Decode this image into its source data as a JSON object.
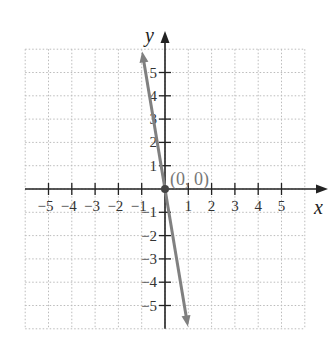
{
  "chart_data": {
    "type": "line",
    "title": "",
    "xlabel": "x",
    "ylabel": "y",
    "xlim": [
      -6,
      6
    ],
    "ylim": [
      -6,
      6
    ],
    "grid": true,
    "grid_style": "dotted",
    "x_ticks": [
      -5,
      -4,
      -3,
      -2,
      -1,
      1,
      2,
      3,
      4,
      5
    ],
    "y_ticks": [
      5,
      4,
      3,
      2,
      1,
      -1,
      -2,
      -3,
      -4,
      -5
    ],
    "x_tick_labels": [
      "−5",
      "−4",
      "−3",
      "−2",
      "−1",
      "1",
      "2",
      "3",
      "4",
      "5"
    ],
    "y_tick_labels": [
      "5",
      "4",
      "3",
      "2",
      "1",
      "−1",
      "−2",
      "−3",
      "−4",
      "−5"
    ],
    "series": [
      {
        "name": "y = -6x",
        "equation": "y = -6x",
        "x": [
          -0.98,
          0,
          0.98
        ],
        "y": [
          5.9,
          0,
          -5.9
        ],
        "arrows": "both",
        "color": "#808080"
      }
    ],
    "annotations": [
      {
        "text": "(0, 0)",
        "x": 0,
        "y": 0,
        "marker": "dot"
      }
    ]
  },
  "colors": {
    "axis": "#222222",
    "grid": "#bbbbbb",
    "line": "#808080",
    "point": "#444444",
    "label": "#777777"
  }
}
